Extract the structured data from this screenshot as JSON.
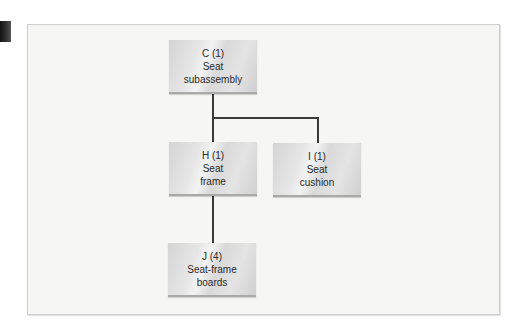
{
  "figure": {
    "type": "product-structure-tree",
    "nodes": [
      {
        "id": "C",
        "label": "C (1)",
        "line2": "Seat",
        "line3": "subassembly",
        "quantity": 1,
        "level": 0
      },
      {
        "id": "H",
        "label": "H (1)",
        "line2": "Seat",
        "line3": "frame",
        "quantity": 1,
        "level": 1,
        "parent": "C"
      },
      {
        "id": "I",
        "label": "I (1)",
        "line2": "Seat",
        "line3": "cushion",
        "quantity": 1,
        "level": 1,
        "parent": "C"
      },
      {
        "id": "J",
        "label": "J (4)",
        "line2": "Seat-frame",
        "line3": "boards",
        "quantity": 4,
        "level": 2,
        "parent": "H"
      }
    ],
    "colors": {
      "node_fill": "#e0e0e0",
      "connector": "#3a3a3a",
      "frame_bg": "#f6f6f5",
      "frame_border": "#cfcfcf"
    }
  }
}
